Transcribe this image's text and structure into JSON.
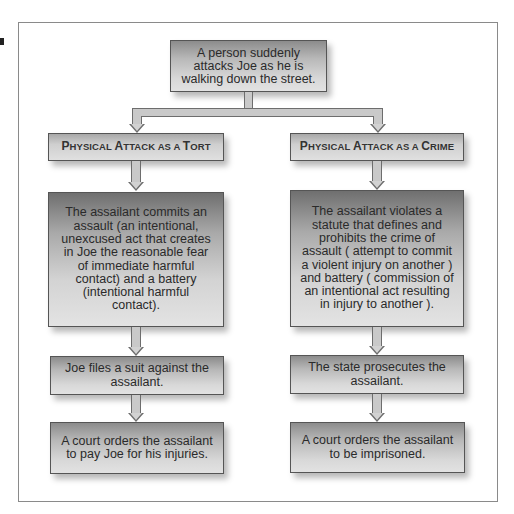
{
  "diagram": {
    "top_event": "A person suddenly attacks Joe as he is walking down the street.",
    "branches": [
      {
        "id": "tort",
        "header": {
          "parts": [
            {
              "big": "P",
              "small": "HYSICAL "
            },
            {
              "big": "A",
              "small": "TTACK AS A "
            },
            {
              "big": "T",
              "small": "ORT"
            }
          ],
          "full": "Physical Attack as a Tort"
        },
        "description": "The assailant commits an assault (an intentional, unexcused act that creates in Joe the reasonable fear of immediate harmful contact) and a battery (intentional harmful contact).",
        "step1": "Joe files a suit against the assailant.",
        "step2": "A court orders the assailant to pay Joe for his injuries."
      },
      {
        "id": "crime",
        "header": {
          "parts": [
            {
              "big": "P",
              "small": "HYSICAL "
            },
            {
              "big": "A",
              "small": "TTACK AS A "
            },
            {
              "big": "C",
              "small": "RIME"
            }
          ],
          "full": "Physical Attack as a Crime"
        },
        "description": "The assailant violates a statute that defines and prohibits the crime of assault ( attempt to commit a violent injury on another ) and battery ( commission of an intentional act resulting in injury to another ).",
        "step1": "The state prosecutes the assailant.",
        "step2": "A court orders the assailant to be imprisoned."
      }
    ]
  },
  "colors": {
    "box_border": "#555555",
    "box_gradient_top": "#6f6f6f",
    "box_gradient_bottom": "#e3e3e3",
    "arrow_fill": "#c9c9c9",
    "arrow_stroke": "#6d6d6d",
    "frame_border": "#8a8a8a"
  }
}
